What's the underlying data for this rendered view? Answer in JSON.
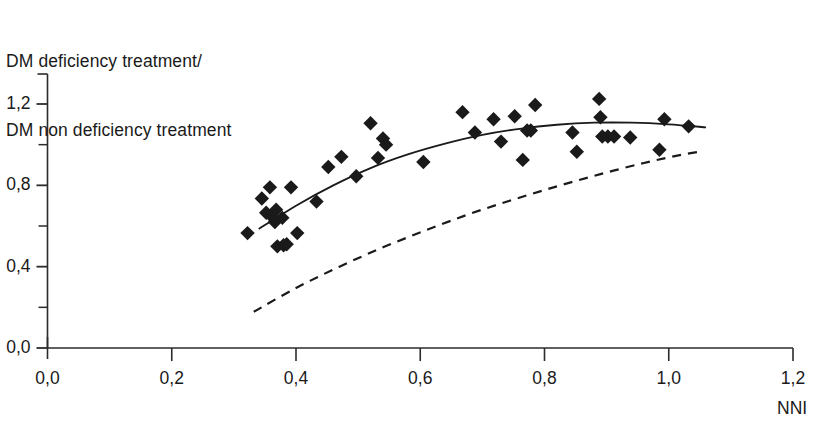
{
  "chart_data": {
    "type": "scatter",
    "title": "DM deficiency treatment/\nDM non deficiency treatment",
    "title_line1": "DM deficiency treatment/",
    "title_line2": "DM non deficiency treatment",
    "xlabel": "NNI",
    "ylabel": "DM deficiency treatment/ DM non deficiency treatment",
    "xlim": [
      0.0,
      1.2
    ],
    "ylim": [
      0.0,
      1.3
    ],
    "grid": false,
    "legend": "none",
    "x_ticks": [
      0.0,
      0.2,
      0.4,
      0.6,
      0.8,
      1.0,
      1.2
    ],
    "x_tick_labels": [
      "0,0",
      "0,2",
      "0,4",
      "0,6",
      "0,8",
      "1,0",
      "1,2"
    ],
    "y_ticks": [
      0.0,
      0.4,
      0.8,
      1.2
    ],
    "y_tick_labels": [
      "0,0",
      "0,4",
      "0,8",
      "1,2"
    ],
    "y_minor_ticks": [
      0.2,
      0.6,
      1.0
    ],
    "marker": "diamond",
    "marker_color": "#1a1a1a",
    "points": [
      {
        "x": 0.322,
        "y": 0.565
      },
      {
        "x": 0.345,
        "y": 0.735
      },
      {
        "x": 0.352,
        "y": 0.665
      },
      {
        "x": 0.358,
        "y": 0.79
      },
      {
        "x": 0.363,
        "y": 0.64
      },
      {
        "x": 0.366,
        "y": 0.62
      },
      {
        "x": 0.368,
        "y": 0.68
      },
      {
        "x": 0.37,
        "y": 0.5
      },
      {
        "x": 0.378,
        "y": 0.64
      },
      {
        "x": 0.38,
        "y": 0.505
      },
      {
        "x": 0.385,
        "y": 0.51
      },
      {
        "x": 0.392,
        "y": 0.79
      },
      {
        "x": 0.402,
        "y": 0.565
      },
      {
        "x": 0.433,
        "y": 0.72
      },
      {
        "x": 0.452,
        "y": 0.89
      },
      {
        "x": 0.473,
        "y": 0.94
      },
      {
        "x": 0.497,
        "y": 0.845
      },
      {
        "x": 0.52,
        "y": 1.105
      },
      {
        "x": 0.532,
        "y": 0.935
      },
      {
        "x": 0.54,
        "y": 1.03
      },
      {
        "x": 0.545,
        "y": 1.0
      },
      {
        "x": 0.605,
        "y": 0.915
      },
      {
        "x": 0.668,
        "y": 1.16
      },
      {
        "x": 0.688,
        "y": 1.06
      },
      {
        "x": 0.718,
        "y": 1.125
      },
      {
        "x": 0.73,
        "y": 1.015
      },
      {
        "x": 0.752,
        "y": 1.14
      },
      {
        "x": 0.765,
        "y": 0.925
      },
      {
        "x": 0.772,
        "y": 1.07
      },
      {
        "x": 0.778,
        "y": 1.07
      },
      {
        "x": 0.785,
        "y": 1.195
      },
      {
        "x": 0.845,
        "y": 1.06
      },
      {
        "x": 0.852,
        "y": 0.965
      },
      {
        "x": 0.888,
        "y": 1.225
      },
      {
        "x": 0.89,
        "y": 1.135
      },
      {
        "x": 0.893,
        "y": 1.04
      },
      {
        "x": 0.902,
        "y": 1.04
      },
      {
        "x": 0.912,
        "y": 1.04
      },
      {
        "x": 0.938,
        "y": 1.035
      },
      {
        "x": 0.985,
        "y": 0.975
      },
      {
        "x": 0.993,
        "y": 1.125
      },
      {
        "x": 1.032,
        "y": 1.09
      }
    ],
    "curves": [
      {
        "name": "solid-fitted-curve",
        "style": "solid",
        "color": "#1a1a1a",
        "points": [
          {
            "x": 0.34,
            "y": 0.585
          },
          {
            "x": 0.4,
            "y": 0.7
          },
          {
            "x": 0.46,
            "y": 0.8
          },
          {
            "x": 0.52,
            "y": 0.885
          },
          {
            "x": 0.58,
            "y": 0.952
          },
          {
            "x": 0.64,
            "y": 1.005
          },
          {
            "x": 0.7,
            "y": 1.048
          },
          {
            "x": 0.76,
            "y": 1.078
          },
          {
            "x": 0.82,
            "y": 1.098
          },
          {
            "x": 0.88,
            "y": 1.108
          },
          {
            "x": 0.94,
            "y": 1.108
          },
          {
            "x": 1.0,
            "y": 1.1
          },
          {
            "x": 1.06,
            "y": 1.085
          }
        ]
      },
      {
        "name": "dashed-reference-curve",
        "style": "dashed",
        "color": "#1a1a1a",
        "points": [
          {
            "x": 0.332,
            "y": 0.178
          },
          {
            "x": 0.4,
            "y": 0.295
          },
          {
            "x": 0.47,
            "y": 0.4
          },
          {
            "x": 0.54,
            "y": 0.495
          },
          {
            "x": 0.61,
            "y": 0.58
          },
          {
            "x": 0.68,
            "y": 0.66
          },
          {
            "x": 0.75,
            "y": 0.73
          },
          {
            "x": 0.82,
            "y": 0.795
          },
          {
            "x": 0.89,
            "y": 0.855
          },
          {
            "x": 0.96,
            "y": 0.91
          },
          {
            "x": 1.02,
            "y": 0.95
          },
          {
            "x": 1.055,
            "y": 0.968
          }
        ]
      }
    ]
  },
  "axes": {
    "x_axis_name": "NNI",
    "y_title_line1": "DM deficiency treatment/",
    "y_title_line2": "DM non deficiency treatment"
  },
  "style": {
    "axis_color": "#2b2b2b",
    "marker_color": "#1a1a1a",
    "background": "#ffffff"
  }
}
